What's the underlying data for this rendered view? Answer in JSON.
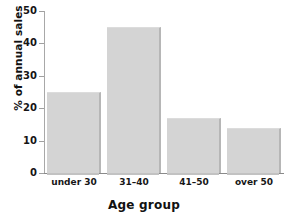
{
  "chart_data": {
    "type": "bar",
    "title": "",
    "categories": [
      "under 30",
      "31–40",
      "41–50",
      "over 50"
    ],
    "values": [
      25,
      45,
      17,
      14
    ],
    "xlabel": "Age group",
    "ylabel": "% of annual sales",
    "ylim": [
      0,
      50
    ],
    "yticks": [
      0,
      10,
      20,
      30,
      40,
      50
    ],
    "ytick_labels": [
      "0",
      "10",
      "20",
      "30",
      "40",
      "50"
    ],
    "grid": false,
    "legend": null,
    "bar_color": "#d4d4d4",
    "bar_edge_color": "#b6b6b6",
    "axis_color": "#9a9a9a",
    "text_color": "#111111",
    "background": "#ffffff"
  }
}
